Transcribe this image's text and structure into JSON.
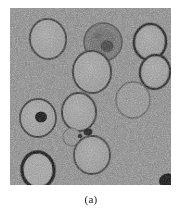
{
  "figure": {
    "caption": "(a)",
    "panel_label": "(a)",
    "modality": "electron-micrograph"
  },
  "panel": {
    "x": 10,
    "y": 8,
    "width": 161,
    "height": 177,
    "background_color": "#858585",
    "noise": {
      "description": "heavy high-frequency grayscale speckle",
      "mean_level": "#828282",
      "dark_level": "#4a4a4a",
      "light_level": "#c4c4c4"
    }
  },
  "features": {
    "vesicles": [
      {
        "id": "vesicle-top-left",
        "cx": 38,
        "cy": 31,
        "rx": 18,
        "ry": 20,
        "rim": "#303030",
        "rim_width": 2.0,
        "fill": "#9a9a9a",
        "rotate": -8
      },
      {
        "id": "vesicle-top-center-dark",
        "cx": 93,
        "cy": 34,
        "rx": 19,
        "ry": 19,
        "rim": "#4a4a4a",
        "rim_width": 1.6,
        "fill": "#6e6e6e",
        "rotate": 0
      },
      {
        "id": "vesicle-top-right",
        "cx": 140,
        "cy": 34,
        "rx": 16,
        "ry": 18,
        "rim": "#161616",
        "rim_width": 2.6,
        "fill": "#9d9d9d",
        "rotate": 6
      },
      {
        "id": "vesicle-center",
        "cx": 82,
        "cy": 64,
        "rx": 19,
        "ry": 21,
        "rim": "#2b2b2b",
        "rim_width": 2.0,
        "fill": "#9e9e9e",
        "rotate": -5
      },
      {
        "id": "vesicle-right-upper",
        "cx": 145,
        "cy": 64,
        "rx": 15,
        "ry": 17,
        "rim": "#1d1d1d",
        "rim_width": 2.4,
        "fill": "#9a9a9a",
        "rotate": 10
      },
      {
        "id": "vesicle-left-dot",
        "cx": 28,
        "cy": 110,
        "rx": 18,
        "ry": 19,
        "rim": "#333333",
        "rim_width": 1.8,
        "fill": "#9c9c9c",
        "rotate": 0
      },
      {
        "id": "vesicle-mid-left",
        "cx": 69,
        "cy": 104,
        "rx": 17,
        "ry": 19,
        "rim": "#2a2a2a",
        "rim_width": 2.0,
        "fill": "#9a9a9a",
        "rotate": -4
      },
      {
        "id": "vesicle-right-faint",
        "cx": 123,
        "cy": 92,
        "rx": 17,
        "ry": 18,
        "rim": "#4f4f4f",
        "rim_width": 1.4,
        "fill": "#969696",
        "rotate": 4
      },
      {
        "id": "vesicle-small-faint",
        "cx": 62,
        "cy": 129,
        "rx": 9,
        "ry": 9,
        "rim": "#5a5a5a",
        "rim_width": 1.2,
        "fill": "#8e8e8e",
        "rotate": 0
      },
      {
        "id": "vesicle-bottom-center",
        "cx": 82,
        "cy": 147,
        "rx": 18,
        "ry": 19,
        "rim": "#2f2f2f",
        "rim_width": 1.8,
        "fill": "#9b9b9b",
        "rotate": 3
      },
      {
        "id": "vesicle-bottom-left",
        "cx": 28,
        "cy": 162,
        "rx": 16,
        "ry": 18,
        "rim": "#0d0d0d",
        "rim_width": 3.4,
        "fill": "#a6a6a6",
        "rotate": -6
      }
    ],
    "dark_blobs": [
      {
        "id": "blob-in-left-vesicle",
        "cx": 31,
        "cy": 109,
        "rx": 6.0,
        "ry": 5.6,
        "fill": "#101010"
      },
      {
        "id": "blob-in-top-vesicle",
        "cx": 97,
        "cy": 38,
        "rx": 6.5,
        "ry": 5.8,
        "fill": "#3c3c3c"
      },
      {
        "id": "blob-mid-free",
        "cx": 78,
        "cy": 124,
        "rx": 4.5,
        "ry": 3.4,
        "fill": "#141414"
      },
      {
        "id": "blob-mid-free-2",
        "cx": 70,
        "cy": 128,
        "rx": 2.4,
        "ry": 2.0,
        "fill": "#1a1a1a"
      },
      {
        "id": "blob-corner-bottom-right",
        "cx": 158,
        "cy": 173,
        "rx": 9.0,
        "ry": 7.5,
        "fill": "#0a0a0a"
      }
    ]
  }
}
